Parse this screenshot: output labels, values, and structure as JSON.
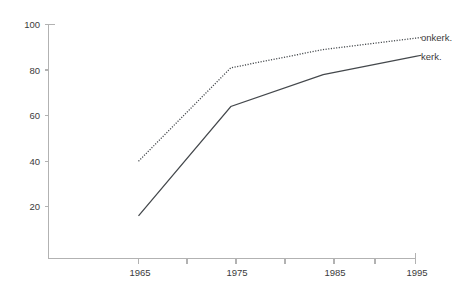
{
  "chart_data": {
    "type": "line",
    "title": "",
    "subtitle": "",
    "xlabel": "",
    "ylabel": "",
    "x": [
      1965,
      1975,
      1985,
      1995
    ],
    "categories": [
      "1965",
      "1975",
      "1985",
      "1995"
    ],
    "series": [
      {
        "name": "onkerk.",
        "style": "dotted",
        "color": "#44484c",
        "values": [
          40,
          81,
          89,
          94
        ]
      },
      {
        "name": "kerk.",
        "style": "solid",
        "color": "#44484c",
        "values": [
          16,
          64,
          78,
          86
        ]
      }
    ],
    "xlim": [
      1960,
      1995
    ],
    "ylim": [
      0,
      100
    ],
    "y_ticks": [
      20,
      40,
      60,
      80,
      100
    ],
    "y_tick_labels": [
      "20",
      "40",
      "60",
      "80",
      "100"
    ],
    "x_ticks": [
      1965,
      1970,
      1975,
      1980,
      1985,
      1990,
      1995
    ],
    "x_tick_labels": [
      "1965",
      "",
      "1975",
      "",
      "1985",
      "",
      "1995"
    ],
    "x_major_labels": [
      "1965",
      "1975",
      "1985",
      "1995"
    ],
    "grid": false,
    "legend_position": "right-inline"
  },
  "axes": {
    "y_labels": [
      "100",
      "80",
      "60",
      "40",
      "20"
    ],
    "x_labels": [
      "1965",
      "1975",
      "1985",
      "1995"
    ]
  },
  "legend": {
    "entries": [
      {
        "label": "onkerk."
      },
      {
        "label": "kerk."
      }
    ],
    "onkerk_label": "onkerk.",
    "kerk_label": "kerk."
  },
  "colors": {
    "line": "#44484c",
    "axis": "#b2b2b2",
    "text": "#3b3b3b",
    "background": "#ffffff"
  }
}
